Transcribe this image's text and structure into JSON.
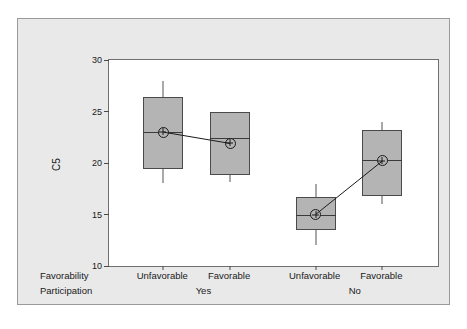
{
  "chart_data": {
    "type": "box",
    "title": "",
    "xlabel": "",
    "ylabel": "C5",
    "ylim": [
      10,
      30
    ],
    "yticks": [
      30,
      25,
      20,
      15,
      10
    ],
    "grid": false,
    "legend": "none",
    "factor_rows": [
      {
        "name": "Favorability",
        "label": "Favorability"
      },
      {
        "name": "Participation",
        "label": "Participation"
      }
    ],
    "groups": [
      {
        "label": "Yes",
        "center_pct": 29.0
      },
      {
        "label": "No",
        "center_pct": 75.0
      }
    ],
    "categories": [
      "Unfavorable",
      "Favorable",
      "Unfavorable",
      "Favorable"
    ],
    "boxes": [
      {
        "name": "unfavorable-yes",
        "category": "Unfavorable",
        "group": "Yes",
        "x_pct": 16.5,
        "whisker_low": 18.1,
        "q1": 19.4,
        "median": 23.0,
        "q3": 26.4,
        "whisker_high": 28.0,
        "mean": 23.0
      },
      {
        "name": "favorable-yes",
        "category": "Favorable",
        "group": "Yes",
        "x_pct": 36.8,
        "whisker_low": 18.2,
        "q1": 18.8,
        "median": 22.4,
        "q3": 25.0,
        "whisker_high": 25.0,
        "mean": 21.9
      },
      {
        "name": "unfavorable-no",
        "category": "Unfavorable",
        "group": "No",
        "x_pct": 62.8,
        "whisker_low": 12.0,
        "q1": 13.5,
        "median": 15.0,
        "q3": 16.7,
        "whisker_high": 18.0,
        "mean": 15.0
      },
      {
        "name": "favorable-no",
        "category": "Favorable",
        "group": "No",
        "x_pct": 83.1,
        "whisker_low": 16.0,
        "q1": 16.8,
        "median": 20.3,
        "q3": 23.2,
        "whisker_high": 24.0,
        "mean": 20.2
      }
    ],
    "mean_connect_lines": [
      {
        "from": 0,
        "to": 1
      },
      {
        "from": 2,
        "to": 3
      }
    ],
    "colors": {
      "box_fill": "#b4b4b4",
      "box_border": "#4a4a4a",
      "plot_background": "#ffffff",
      "figure_background": "#e9e9e9",
      "text": "#1a1a1a",
      "marker": "#1a1a1a"
    }
  },
  "caption": ""
}
